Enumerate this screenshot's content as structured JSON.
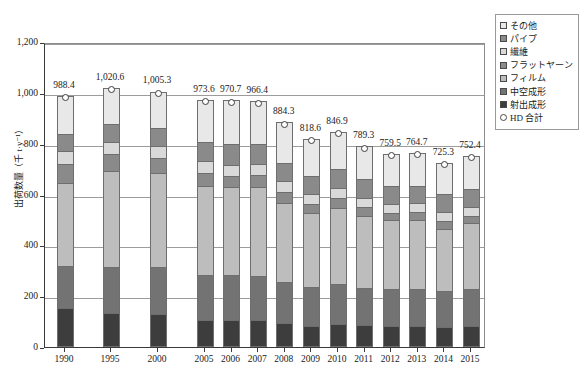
{
  "chart_data": {
    "type": "bar",
    "subtype": "stacked-bar-with-total-line",
    "title": "",
    "xlabel": "",
    "ylabel": "出荷数量（千 t·y⁻¹）",
    "ylim": [
      0,
      1200
    ],
    "yticks": [
      0,
      200,
      400,
      600,
      800,
      1000,
      1200
    ],
    "ytick_labels": [
      "0",
      "200",
      "400",
      "600",
      "800",
      "1,000",
      "1,200"
    ],
    "grid": true,
    "legend_position": "right-top",
    "categories": [
      "1990",
      "1995",
      "2000",
      "2005",
      "2006",
      "2007",
      "2008",
      "2009",
      "2010",
      "2011",
      "2012",
      "2013",
      "2014",
      "2015"
    ],
    "series": [
      {
        "name": "射出成形",
        "color": "#3d3d3d",
        "values": [
          155.0,
          133.0,
          128.0,
          107.0,
          106.0,
          105.0,
          96.0,
          84.0,
          91.0,
          85.0,
          84.0,
          84.0,
          80.0,
          83.0
        ]
      },
      {
        "name": "中空成形",
        "color": "#737373",
        "values": [
          165.0,
          180.0,
          185.0,
          175.0,
          176.0,
          174.0,
          160.0,
          151.0,
          155.0,
          147.0,
          143.0,
          146.0,
          140.0,
          146.0
        ]
      },
      {
        "name": "フィルム",
        "color": "#bdbdbd",
        "values": [
          325.0,
          380.0,
          370.0,
          353.0,
          346.0,
          350.0,
          312.0,
          292.0,
          301.0,
          284.0,
          272.0,
          271.0,
          243.0,
          257.0
        ]
      },
      {
        "name": "フラットヤーン",
        "color": "#8a8a8a",
        "values": [
          75.0,
          65.0,
          62.0,
          49.0,
          45.0,
          47.0,
          42.0,
          36.0,
          39.0,
          34.0,
          30.0,
          30.0,
          32.0,
          31.0
        ]
      },
      {
        "name": "繊維",
        "color": "#d9d9d9",
        "values": [
          50.0,
          48.0,
          47.0,
          47.0,
          45.0,
          46.0,
          42.0,
          38.0,
          40.0,
          38.0,
          35.0,
          34.0,
          38.0,
          35.0
        ]
      },
      {
        "name": "パイプ",
        "color": "#8a8a8a",
        "values": [
          70.0,
          72.0,
          70.0,
          76.0,
          79.0,
          78.0,
          73.0,
          73.0,
          75.0,
          72.0,
          70.0,
          70.0,
          70.0,
          71.0
        ]
      },
      {
        "name": "その他",
        "color": "#e8e8e8",
        "values": [
          148.4,
          142.6,
          143.3,
          166.6,
          173.7,
          166.4,
          159.3,
          144.6,
          145.9,
          129.3,
          125.5,
          129.7,
          122.3,
          129.4
        ]
      }
    ],
    "total_series": {
      "name": "HD 合計",
      "marker": "open-circle",
      "values": [
        988.4,
        1020.6,
        1005.3,
        973.6,
        970.7,
        966.4,
        884.3,
        818.6,
        846.9,
        789.3,
        759.5,
        764.7,
        725.3,
        752.4
      ],
      "labels": [
        "988.4",
        "1,020.6",
        "1,005.3",
        "973.6",
        "970.7",
        "966.4",
        "884.3",
        "818.6",
        "846.9",
        "789.3",
        "759.5",
        "764.7",
        "725.3",
        "752.4"
      ]
    }
  },
  "legend": {
    "items": [
      {
        "label": "その他",
        "swatch": "legend-swatch-sonota",
        "color": "#e8e8e8",
        "shape": "square"
      },
      {
        "label": "パイプ",
        "swatch": "legend-swatch-pipe",
        "color": "#8a8a8a",
        "shape": "square"
      },
      {
        "label": "繊維",
        "swatch": "legend-swatch-fiber",
        "color": "#d9d9d9",
        "shape": "square"
      },
      {
        "label": "フラットヤーン",
        "swatch": "legend-swatch-flatyarn",
        "color": "#8a8a8a",
        "shape": "square"
      },
      {
        "label": "フィルム",
        "swatch": "legend-swatch-film",
        "color": "#bdbdbd",
        "shape": "square"
      },
      {
        "label": "中空成形",
        "swatch": "legend-swatch-blow",
        "color": "#737373",
        "shape": "square"
      },
      {
        "label": "射出成形",
        "swatch": "legend-swatch-injection",
        "color": "#3d3d3d",
        "shape": "square"
      },
      {
        "label": "HD 合計",
        "swatch": "legend-swatch-total",
        "color": "#ffffff",
        "shape": "circle"
      }
    ]
  },
  "axes": {
    "y_title": "出荷数量（千 t·y⁻¹）"
  }
}
